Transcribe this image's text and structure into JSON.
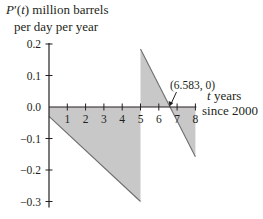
{
  "chart_data": {
    "type": "area",
    "title": "",
    "ylabel_line1": "P′(t) million barrels",
    "ylabel_line1_italic_part": "t",
    "ylabel_line2": "per day per year",
    "xlabel_line1": "t years",
    "xlabel_line2": "since 2000",
    "xlim": [
      0,
      8
    ],
    "ylim": [
      -0.3,
      0.2
    ],
    "x_ticks": [
      1,
      2,
      3,
      4,
      5,
      6,
      7,
      8
    ],
    "x_tick_labels": [
      "1",
      "2",
      "3",
      "4",
      "5",
      "6",
      "7",
      "8"
    ],
    "y_ticks": [
      0.2,
      0.1,
      0.0,
      -0.1,
      -0.2,
      -0.3
    ],
    "y_tick_labels": [
      "0.2",
      "0.1",
      "0.0",
      "−0.1",
      "−0.2",
      "−0.3"
    ],
    "grid": false,
    "legend": null,
    "series": [
      {
        "name": "P′(t) segment 1",
        "x": [
          0,
          5
        ],
        "y": [
          -0.03,
          -0.3
        ],
        "fill_to_axis": true
      },
      {
        "name": "P′(t) segment 2",
        "x": [
          5,
          8
        ],
        "y": [
          0.184,
          -0.158
        ],
        "fill_to_axis": true
      }
    ],
    "annotations": [
      {
        "text": "(6.583, 0)",
        "x": 6.583,
        "y": 0,
        "arrow": true
      }
    ],
    "colors": {
      "fill": "#c8c8c8",
      "line": "#6d6e71",
      "axis": "#231f20",
      "text": "#231f20"
    }
  }
}
